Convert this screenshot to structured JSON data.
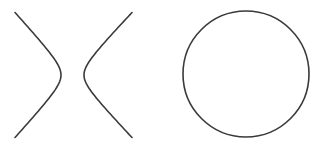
{
  "figure": {
    "background": "#ffffff",
    "stroke_color": "#3a3a3a",
    "shapes": [
      {
        "name": "hyperbola",
        "branches": [
          {
            "side": "left",
            "top": [
              15,
              12
            ],
            "vertex": [
              61,
              75
            ],
            "bottom": [
              15,
              137
            ]
          },
          {
            "side": "right",
            "top": [
              132,
              12
            ],
            "vertex": [
              84,
              75
            ],
            "bottom": [
              132,
              137
            ]
          }
        ]
      },
      {
        "name": "circle",
        "center": [
          246,
          74
        ],
        "radius": 63
      }
    ]
  }
}
